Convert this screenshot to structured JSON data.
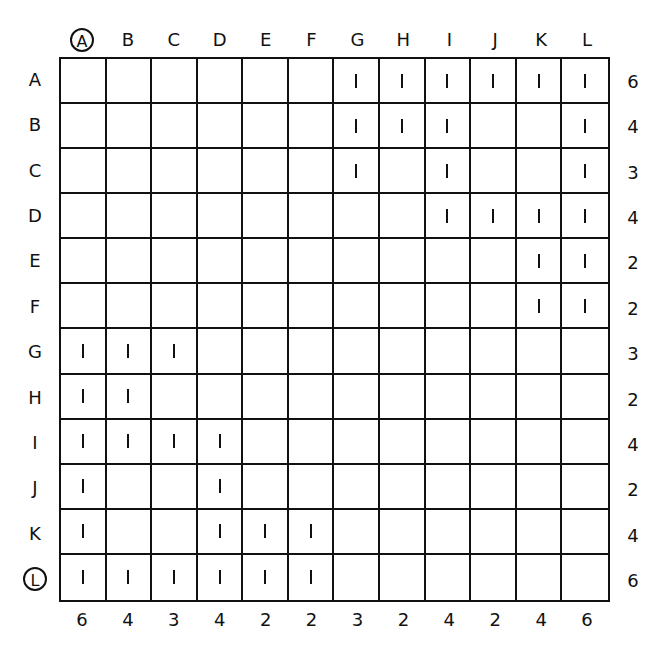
{
  "diagram": {
    "column_labels": [
      "A",
      "B",
      "C",
      "D",
      "E",
      "F",
      "G",
      "H",
      "I",
      "J",
      "K",
      "L"
    ],
    "row_labels": [
      "A",
      "B",
      "C",
      "D",
      "E",
      "F",
      "G",
      "H",
      "I",
      "J",
      "K",
      "L"
    ],
    "circled_column_label": "A",
    "circled_row_label": "L",
    "cell_mark": "1",
    "matrix": [
      [
        0,
        0,
        0,
        0,
        0,
        0,
        1,
        1,
        1,
        1,
        1,
        1
      ],
      [
        0,
        0,
        0,
        0,
        0,
        0,
        1,
        1,
        1,
        0,
        0,
        1
      ],
      [
        0,
        0,
        0,
        0,
        0,
        0,
        1,
        0,
        1,
        0,
        0,
        1
      ],
      [
        0,
        0,
        0,
        0,
        0,
        0,
        0,
        0,
        1,
        1,
        1,
        1
      ],
      [
        0,
        0,
        0,
        0,
        0,
        0,
        0,
        0,
        0,
        0,
        1,
        1
      ],
      [
        0,
        0,
        0,
        0,
        0,
        0,
        0,
        0,
        0,
        0,
        1,
        1
      ],
      [
        1,
        1,
        1,
        0,
        0,
        0,
        0,
        0,
        0,
        0,
        0,
        0
      ],
      [
        1,
        1,
        0,
        0,
        0,
        0,
        0,
        0,
        0,
        0,
        0,
        0
      ],
      [
        1,
        1,
        1,
        1,
        0,
        0,
        0,
        0,
        0,
        0,
        0,
        0
      ],
      [
        1,
        0,
        0,
        1,
        0,
        0,
        0,
        0,
        0,
        0,
        0,
        0
      ],
      [
        1,
        0,
        0,
        1,
        1,
        1,
        0,
        0,
        0,
        0,
        0,
        0
      ],
      [
        1,
        1,
        1,
        1,
        1,
        1,
        0,
        0,
        0,
        0,
        0,
        0
      ]
    ],
    "row_sums": [
      "6",
      "4",
      "3",
      "4",
      "2",
      "2",
      "3",
      "2",
      "4",
      "2",
      "4",
      "6"
    ],
    "column_sums": [
      "6",
      "4",
      "3",
      "4",
      "2",
      "2",
      "3",
      "2",
      "4",
      "2",
      "4",
      "6"
    ],
    "colors": {
      "line": "#111111",
      "background": "#ffffff"
    }
  }
}
